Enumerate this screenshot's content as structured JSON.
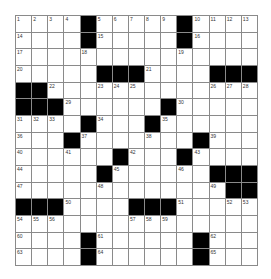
{
  "puzzle": {
    "rows": 15,
    "cols": 15,
    "colors": {
      "block": "#000000",
      "cell": "#ffffff",
      "line": "#8a8a8a",
      "number": "#333333"
    },
    "grid": [
      [
        "1",
        "2",
        "3",
        "4",
        "#",
        "5",
        "6",
        "7",
        "8",
        "9",
        "#",
        "10",
        "11",
        "12",
        "13"
      ],
      [
        "14",
        ".",
        ".",
        ".",
        "#",
        "15",
        ".",
        ".",
        ".",
        ".",
        "#",
        "16",
        ".",
        ".",
        "."
      ],
      [
        "17",
        ".",
        ".",
        ".",
        "18",
        ".",
        ".",
        ".",
        ".",
        ".",
        "19",
        ".",
        ".",
        ".",
        "."
      ],
      [
        "20",
        ".",
        ".",
        ".",
        ".",
        "#",
        "#",
        "#",
        "21",
        ".",
        ".",
        ".",
        "#",
        "#",
        "#"
      ],
      [
        "#",
        "#",
        "22",
        ".",
        ".",
        "23",
        "24",
        "25",
        ".",
        ".",
        ".",
        ".",
        "26",
        "27",
        "28"
      ],
      [
        "#",
        "#",
        "#",
        "29",
        ".",
        ".",
        ".",
        ".",
        ".",
        "#",
        "30",
        ".",
        ".",
        ".",
        "."
      ],
      [
        "31",
        "32",
        "33",
        ".",
        "#",
        "34",
        ".",
        ".",
        "#",
        "35",
        ".",
        ".",
        ".",
        ".",
        "."
      ],
      [
        "36",
        ".",
        ".",
        "#",
        "37",
        ".",
        ".",
        ".",
        "38",
        ".",
        ".",
        "#",
        "39",
        ".",
        "."
      ],
      [
        "40",
        ".",
        ".",
        "41",
        ".",
        ".",
        "#",
        "42",
        ".",
        ".",
        "#",
        "43",
        ".",
        ".",
        "."
      ],
      [
        "44",
        ".",
        ".",
        ".",
        ".",
        "#",
        "45",
        ".",
        ".",
        ".",
        "46",
        ".",
        "#",
        "#",
        "#"
      ],
      [
        "47",
        ".",
        ".",
        ".",
        ".",
        "48",
        ".",
        ".",
        ".",
        ".",
        ".",
        ".",
        "49",
        "#",
        "#"
      ],
      [
        "#",
        "#",
        "#",
        "50",
        ".",
        ".",
        ".",
        "#",
        "#",
        "#",
        "51",
        ".",
        ".",
        "52",
        "53"
      ],
      [
        "54",
        "55",
        "56",
        ".",
        ".",
        ".",
        ".",
        "57",
        "58",
        "59",
        ".",
        ".",
        ".",
        ".",
        "."
      ],
      [
        "60",
        ".",
        ".",
        ".",
        "#",
        "61",
        ".",
        ".",
        ".",
        ".",
        ".",
        "#",
        "62",
        ".",
        "."
      ],
      [
        "63",
        ".",
        ".",
        ".",
        "#",
        "64",
        ".",
        ".",
        ".",
        ".",
        ".",
        "#",
        "65",
        ".",
        "."
      ]
    ]
  }
}
